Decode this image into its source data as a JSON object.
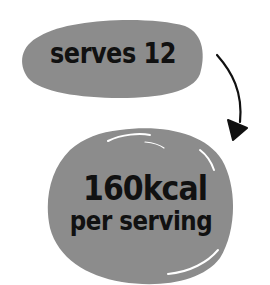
{
  "top_badge": {
    "text": "serves 12",
    "fill_color": "#8c8c8c"
  },
  "bottom_badge": {
    "calories": "160kcal",
    "subtitle": "per serving",
    "fill_color": "#8c8c8c"
  },
  "connector": {
    "icon": "curved-arrow-down-icon",
    "color": "#111111"
  }
}
